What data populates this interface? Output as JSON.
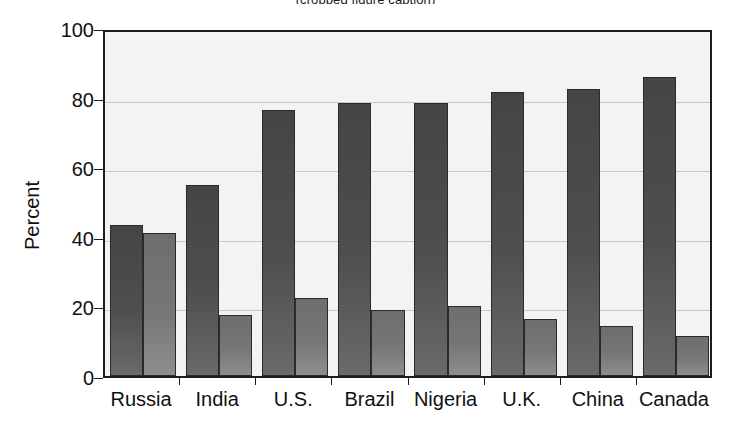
{
  "chart_data": {
    "type": "bar",
    "title": "",
    "xlabel": "",
    "ylabel": "Percent",
    "ylim": [
      0,
      100
    ],
    "yticks": [
      0,
      20,
      40,
      60,
      80,
      100
    ],
    "grid": true,
    "legend": "none",
    "categories": [
      "Russia",
      "India",
      "U.S.",
      "Brazil",
      "Nigeria",
      "U.K.",
      "China",
      "Canada"
    ],
    "series": [
      {
        "name": "series-a",
        "color": "#4a4a4a",
        "values": [
          43.5,
          55.0,
          76.5,
          78.5,
          78.5,
          81.5,
          82.5,
          86.0
        ]
      },
      {
        "name": "series-b",
        "color": "#777777",
        "values": [
          41.0,
          17.5,
          22.5,
          19.0,
          20.0,
          16.5,
          14.5,
          11.5
        ]
      }
    ]
  },
  "axis": {
    "y_title": "Percent",
    "y_tick_labels": [
      "0",
      "20",
      "40",
      "60",
      "80",
      "100"
    ],
    "x_tick_labels": [
      "Russia",
      "India",
      "U.S.",
      "Brazil",
      "Nigeria",
      "U.K.",
      "China",
      "Canada"
    ]
  },
  "title_sliver": "(cropped figure caption)",
  "colors": {
    "plot_background": "#f3f3f1",
    "frame": "#1c1c1c",
    "gridline": "#c9c9c7",
    "bar_dark": "#4a4a4a",
    "bar_light": "#777777",
    "text": "#111111"
  }
}
